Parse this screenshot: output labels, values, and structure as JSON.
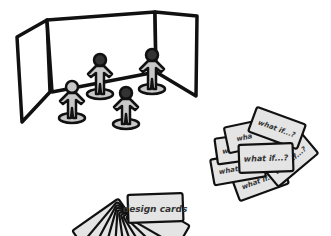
{
  "illustration": {
    "colors": {
      "outline": "#111111",
      "figure_fill": "#c8c8c8",
      "card_fill": "#e4e4e4",
      "panel_fill": "#ffffff",
      "text": "#333333"
    },
    "stage": {
      "label": "",
      "figures_count": 4
    },
    "design_cards": {
      "label": "design cards",
      "cards_count": 11
    },
    "what_if_cards": {
      "label": "what if...?",
      "labels": [
        "what if...?",
        "what if...?",
        "what if...?",
        "wha",
        "wha",
        "what if...?",
        "what if...?",
        "what if...?"
      ]
    }
  }
}
